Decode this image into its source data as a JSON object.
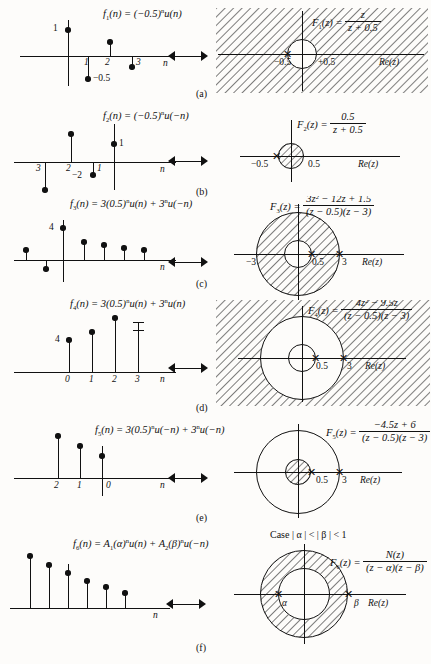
{
  "figure": {
    "arrow_symbol": "two-way-arrow",
    "colors": {
      "ink": "#111111",
      "paper": "#fdfcfa",
      "hatch": "#111111"
    }
  },
  "rows": [
    {
      "caption": "(a)",
      "time": {
        "label_parts": {
          "fname": "f",
          "fsub": "1",
          "arg": "(n)",
          "eq": "= (−0.5)",
          "expo": "n",
          "u": "u(n)"
        },
        "axis_label": "n",
        "value_labels": [
          {
            "text": "1"
          },
          {
            "text": "−0.5"
          }
        ],
        "ticks": [
          "1",
          "2",
          "3"
        ],
        "samples": [
          {
            "n": 0,
            "value": 1
          },
          {
            "n": 1,
            "value": -0.5
          },
          {
            "n": 2,
            "value": 0.25
          },
          {
            "n": 3,
            "value": -0.125
          }
        ]
      },
      "zplane": {
        "transform": {
          "lhs": "F",
          "lhs_sub": "1",
          "lhs_arg": "(z)",
          "num": "z",
          "den": "z + 0.5"
        },
        "re_label": "Re(z)",
        "tick_left": "−0.5",
        "tick_right": "+0.5",
        "roc_type": "exterior",
        "roc_text": "|z| > 0.5",
        "poles": [
          "−0.5"
        ],
        "circle_radii": [
          "0.5"
        ]
      }
    },
    {
      "caption": "(b)",
      "time": {
        "label_parts": {
          "fname": "f",
          "fsub": "2",
          "arg": "(n)",
          "eq": "= (−0.5)",
          "expo": "n",
          "u": "u(−n)"
        },
        "axis_label": "n",
        "value_labels": [
          {
            "text": "1"
          },
          {
            "text": "−2"
          }
        ],
        "ticks": [
          "3",
          "2",
          "1"
        ],
        "samples": [
          {
            "n": 0,
            "value": 1
          },
          {
            "n": -1,
            "value": -2
          },
          {
            "n": -2,
            "value": 4
          },
          {
            "n": -3,
            "value": -8
          }
        ]
      },
      "zplane": {
        "transform": {
          "lhs": "F",
          "lhs_sub": "2",
          "lhs_arg": "(z)",
          "num": "0.5",
          "den": "z + 0.5"
        },
        "re_label": "Re(z)",
        "tick_left": "−0.5",
        "tick_right": "0.5",
        "roc_type": "interior",
        "roc_text": "|z| < 0.5",
        "poles": [
          "−0.5"
        ],
        "circle_radii": [
          "0.5"
        ]
      }
    },
    {
      "caption": "(c)",
      "time": {
        "label_parts": {
          "fname": "f",
          "fsub": "3",
          "arg": "(n)",
          "eq": "= 3(0.5)",
          "expo": "n",
          "u": "u(n) + 3",
          "expo2": "n",
          "u2": "u(−n)"
        },
        "axis_label": "n",
        "value_labels": [
          {
            "text": "4"
          }
        ],
        "ticks": [],
        "samples": [
          {
            "n": -2,
            "value": 0.9
          },
          {
            "n": -1,
            "value": -0.5
          },
          {
            "n": 0,
            "value": 4
          },
          {
            "n": 1,
            "value": 1.9
          },
          {
            "n": 2,
            "value": 1.5
          },
          {
            "n": 3,
            "value": 1.1
          },
          {
            "n": 4,
            "value": 0.85
          }
        ]
      },
      "zplane": {
        "transform": {
          "lhs": "F",
          "lhs_sub": "3",
          "lhs_arg": "(z)",
          "num": "3z² − 12z + 1.5",
          "den": "(z − 0.5)(z − 3)"
        },
        "re_label": "Re(z)",
        "tick_left": "−3",
        "tick_mid": "0.5",
        "tick_right": "3",
        "roc_type": "annulus",
        "roc_text": "0.5 < |z| < 3",
        "poles": [
          "0.5",
          "3"
        ],
        "circle_radii": [
          "0.5",
          "3"
        ]
      }
    },
    {
      "caption": "(d)",
      "time": {
        "label_parts": {
          "fname": "f",
          "fsub": "4",
          "arg": "(n)",
          "eq": "= 3(0.5)",
          "expo": "n",
          "u": "u(n) + 3",
          "expo2": "n",
          "u2": "u(n)"
        },
        "axis_label": "n",
        "value_labels": [
          {
            "text": "4"
          }
        ],
        "ticks": [
          "0",
          "1",
          "2",
          "3"
        ],
        "samples": [
          {
            "n": 0,
            "value": 4
          },
          {
            "n": 1,
            "value": 4.5
          },
          {
            "n": 2,
            "value": 5.4
          },
          {
            "n": 3,
            "value": 6.2
          }
        ]
      },
      "zplane": {
        "transform": {
          "lhs": "F",
          "lhs_sub": "4",
          "lhs_arg": "(z)",
          "num": "4z² − 9.5z",
          "den": "(z − 0.5)(z − 3)"
        },
        "re_label": "Re(z)",
        "tick_mid": "0.5",
        "tick_right": "3",
        "roc_type": "exterior",
        "roc_text": "|z| > 3",
        "poles": [
          "0.5",
          "3"
        ],
        "circle_radii": [
          "0.5",
          "3"
        ]
      }
    },
    {
      "caption": "(e)",
      "time": {
        "label_parts": {
          "fname": "f",
          "fsub": "5",
          "arg": "(n)",
          "eq": "= 3(0.5)",
          "expo": "n",
          "u": "u(−n) + 3",
          "expo2": "n",
          "u2": "u(−n)"
        },
        "axis_label": "n",
        "value_labels": [],
        "ticks": [
          "2",
          "1",
          "0"
        ],
        "samples": [
          {
            "n": -2,
            "value": 6.2
          },
          {
            "n": -1,
            "value": 5.0
          },
          {
            "n": 0,
            "value": 4.0
          }
        ]
      },
      "zplane": {
        "transform": {
          "lhs": "F",
          "lhs_sub": "5",
          "lhs_arg": "(z)",
          "num": "−4.5z + 6",
          "den": "(z − 0.5)(z − 3)"
        },
        "re_label": "Re(z)",
        "tick_mid": "0.5",
        "tick_right": "3",
        "roc_type": "interior",
        "roc_text": "|z| < 0.5",
        "poles": [
          "0.5",
          "3"
        ],
        "circle_radii": [
          "0.5",
          "3"
        ]
      }
    },
    {
      "caption": "(f)",
      "time": {
        "label_parts": {
          "fname": "f",
          "fsub": "6",
          "arg": "(n)",
          "eq": "= A",
          "eqsub": "1",
          "alpha": "(α)",
          "expo": "n",
          "u": "u(n) + A",
          "eqsub2": "2",
          "beta": "(β)",
          "expo2": "n",
          "u2": "u(−n)"
        },
        "axis_label": "n",
        "value_labels": [],
        "ticks": [],
        "samples": [
          {
            "n": -2,
            "value": 5.6
          },
          {
            "n": -1,
            "value": 4.5
          },
          {
            "n": 0,
            "value": 3.7
          },
          {
            "n": 1,
            "value": 2.9
          },
          {
            "n": 2,
            "value": 2.3
          },
          {
            "n": 3,
            "value": 1.7
          }
        ]
      },
      "zplane": {
        "case_note": "Case | α | < | β | < 1",
        "transform": {
          "lhs": "F",
          "lhs_sub": "6",
          "lhs_arg": "(z)",
          "num": "N(z)",
          "den": "(z − α)(z − β)"
        },
        "re_label": "Re(z)",
        "tick_alpha": "α",
        "tick_beta": "β",
        "roc_type": "annulus",
        "roc_text": "|α| < |z| < |β|",
        "poles": [
          "α",
          "β"
        ],
        "circle_radii": [
          "α",
          "β"
        ]
      }
    }
  ]
}
